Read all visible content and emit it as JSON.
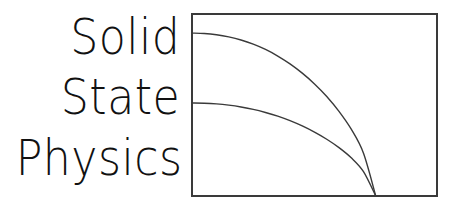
{
  "canvas": {
    "width": 459,
    "height": 218,
    "background_color": "#ffffff"
  },
  "wordmark": {
    "lines": [
      {
        "text": "Solid"
      },
      {
        "text": "State"
      },
      {
        "text": "Physics"
      }
    ],
    "full_text": "Solid State Physics",
    "color": "#111111"
  },
  "plot": {
    "frame": {
      "stroke_color": "#3a3a3a",
      "stroke_width": 1.6,
      "x": 192,
      "y": 14,
      "width": 245,
      "height": 182
    },
    "grid": false,
    "axis_labels_visible": false,
    "tick_labels_visible": false,
    "legend_visible": false,
    "curve_color": "#3a3a3a",
    "curve_stroke_width": 1.4,
    "convergence_point_label": "zone-boundary"
  },
  "chart_data": {
    "type": "line",
    "title": "",
    "subtitle": "",
    "xlabel": "",
    "ylabel": "",
    "xlim": [
      0,
      1
    ],
    "ylim": [
      0,
      1
    ],
    "grid": false,
    "legend": "none",
    "annotations": [],
    "xticklabels": [],
    "yticklabels": [],
    "series": [
      {
        "name": "upper-branch",
        "x": [
          0.0,
          0.05,
          0.1,
          0.15,
          0.2,
          0.25,
          0.3,
          0.35,
          0.4,
          0.45,
          0.5,
          0.55,
          0.6,
          0.65,
          0.7,
          0.75
        ],
        "y": [
          0.895,
          0.893,
          0.886,
          0.874,
          0.857,
          0.834,
          0.805,
          0.769,
          0.726,
          0.675,
          0.616,
          0.547,
          0.465,
          0.367,
          0.235,
          0.0
        ]
      },
      {
        "name": "lower-branch",
        "x": [
          0.0,
          0.05,
          0.1,
          0.15,
          0.2,
          0.25,
          0.3,
          0.35,
          0.4,
          0.45,
          0.5,
          0.55,
          0.6,
          0.65,
          0.7,
          0.75
        ],
        "y": [
          0.511,
          0.51,
          0.506,
          0.499,
          0.489,
          0.476,
          0.459,
          0.439,
          0.414,
          0.385,
          0.351,
          0.312,
          0.266,
          0.21,
          0.134,
          0.0
        ]
      }
    ]
  }
}
